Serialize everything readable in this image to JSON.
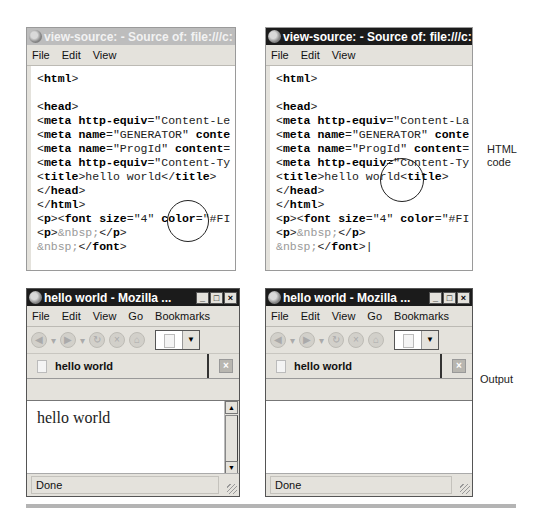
{
  "source_windows": [
    {
      "title": "view-source: - Source of: file:///c:",
      "title_state": "inactive",
      "menu": [
        "File",
        "Edit",
        "View"
      ],
      "code_lines": [
        [
          {
            "t": "<",
            "s": "n"
          },
          {
            "t": "html",
            "s": "b"
          },
          {
            "t": ">",
            "s": "n"
          }
        ],
        [],
        [
          {
            "t": "<",
            "s": "n"
          },
          {
            "t": "head",
            "s": "b"
          },
          {
            "t": ">",
            "s": "n"
          }
        ],
        [
          {
            "t": "<",
            "s": "n"
          },
          {
            "t": "meta http-equiv",
            "s": "b"
          },
          {
            "t": "=\"Content-Le",
            "s": "n"
          }
        ],
        [
          {
            "t": "<",
            "s": "n"
          },
          {
            "t": "meta name",
            "s": "b"
          },
          {
            "t": "=\"GENERATOR\" ",
            "s": "n"
          },
          {
            "t": "conte",
            "s": "b"
          }
        ],
        [
          {
            "t": "<",
            "s": "n"
          },
          {
            "t": "meta name",
            "s": "b"
          },
          {
            "t": "=\"ProgId\" ",
            "s": "n"
          },
          {
            "t": "content",
            "s": "b"
          },
          {
            "t": "=",
            "s": "n"
          }
        ],
        [
          {
            "t": "<",
            "s": "n"
          },
          {
            "t": "meta http-equiv",
            "s": "b"
          },
          {
            "t": "=\"Content-Ty",
            "s": "n"
          }
        ],
        [
          {
            "t": "<",
            "s": "n"
          },
          {
            "t": "title",
            "s": "b"
          },
          {
            "t": ">hello world</",
            "s": "n"
          },
          {
            "t": "title",
            "s": "b"
          },
          {
            "t": ">",
            "s": "n"
          }
        ],
        [
          {
            "t": "</",
            "s": "n"
          },
          {
            "t": "head",
            "s": "b"
          },
          {
            "t": ">",
            "s": "n"
          }
        ],
        [
          {
            "t": "</",
            "s": "n"
          },
          {
            "t": "html",
            "s": "b"
          },
          {
            "t": ">",
            "s": "n"
          }
        ],
        [
          {
            "t": "<",
            "s": "n"
          },
          {
            "t": "p",
            "s": "b"
          },
          {
            "t": "><",
            "s": "n"
          },
          {
            "t": "font size",
            "s": "b"
          },
          {
            "t": "=\"4\" ",
            "s": "n"
          },
          {
            "t": "color",
            "s": "b"
          },
          {
            "t": "=\"#FI",
            "s": "n"
          }
        ],
        [
          {
            "t": "<",
            "s": "n"
          },
          {
            "t": "p",
            "s": "b"
          },
          {
            "t": ">",
            "s": "n"
          },
          {
            "t": "&nbsp;",
            "s": "g"
          },
          {
            "t": "</",
            "s": "n"
          },
          {
            "t": "p",
            "s": "b"
          },
          {
            "t": ">",
            "s": "n"
          }
        ],
        [
          {
            "t": "&nbsp;",
            "s": "g"
          },
          {
            "t": "</",
            "s": "n"
          },
          {
            "t": "font",
            "s": "b"
          },
          {
            "t": ">",
            "s": "n"
          }
        ]
      ]
    },
    {
      "title": "view-source: - Source of: file:///c:",
      "title_state": "active",
      "menu": [
        "File",
        "Edit",
        "View"
      ],
      "code_lines": [
        [
          {
            "t": "<",
            "s": "n"
          },
          {
            "t": "html",
            "s": "b"
          },
          {
            "t": ">",
            "s": "n"
          }
        ],
        [],
        [
          {
            "t": "<",
            "s": "n"
          },
          {
            "t": "head",
            "s": "b"
          },
          {
            "t": ">",
            "s": "n"
          }
        ],
        [
          {
            "t": "<",
            "s": "n"
          },
          {
            "t": "meta http-equiv",
            "s": "b"
          },
          {
            "t": "=\"Content-La",
            "s": "n"
          }
        ],
        [
          {
            "t": "<",
            "s": "n"
          },
          {
            "t": "meta name",
            "s": "b"
          },
          {
            "t": "=\"GENERATOR\" ",
            "s": "n"
          },
          {
            "t": "conte",
            "s": "b"
          }
        ],
        [
          {
            "t": "<",
            "s": "n"
          },
          {
            "t": "meta name",
            "s": "b"
          },
          {
            "t": "=\"ProgId\" ",
            "s": "n"
          },
          {
            "t": "content",
            "s": "b"
          },
          {
            "t": "=",
            "s": "n"
          }
        ],
        [
          {
            "t": "<",
            "s": "n"
          },
          {
            "t": "meta http-equiv",
            "s": "b"
          },
          {
            "t": "=\"Content-Ty",
            "s": "n"
          }
        ],
        [
          {
            "t": "<",
            "s": "n"
          },
          {
            "t": "title",
            "s": "b"
          },
          {
            "t": ">hello world<",
            "s": "n"
          },
          {
            "t": "title",
            "s": "b"
          },
          {
            "t": ">",
            "s": "n"
          }
        ],
        [
          {
            "t": "</",
            "s": "n"
          },
          {
            "t": "head",
            "s": "b"
          },
          {
            "t": ">",
            "s": "n"
          }
        ],
        [
          {
            "t": "</",
            "s": "n"
          },
          {
            "t": "html",
            "s": "b"
          },
          {
            "t": ">",
            "s": "n"
          }
        ],
        [
          {
            "t": "<",
            "s": "n"
          },
          {
            "t": "p",
            "s": "b"
          },
          {
            "t": "><",
            "s": "n"
          },
          {
            "t": "font size",
            "s": "b"
          },
          {
            "t": "=\"4\" ",
            "s": "n"
          },
          {
            "t": "color",
            "s": "b"
          },
          {
            "t": "=\"#FI",
            "s": "n"
          }
        ],
        [
          {
            "t": "<",
            "s": "n"
          },
          {
            "t": "p",
            "s": "b"
          },
          {
            "t": ">",
            "s": "n"
          },
          {
            "t": "&nbsp;",
            "s": "g"
          },
          {
            "t": "</",
            "s": "n"
          },
          {
            "t": "p",
            "s": "b"
          },
          {
            "t": ">",
            "s": "n"
          }
        ],
        [
          {
            "t": "&nbsp;",
            "s": "g"
          },
          {
            "t": "</",
            "s": "n"
          },
          {
            "t": "font",
            "s": "b"
          },
          {
            "t": ">",
            "s": "n"
          },
          {
            "t": "|",
            "s": "n"
          }
        ]
      ]
    }
  ],
  "browser_windows": [
    {
      "title": "hello world - Mozilla ...",
      "title_state": "active",
      "menu": [
        "File",
        "Edit",
        "View",
        "Go",
        "Bookmarks"
      ],
      "tab_label": "hello world",
      "page_text": "hello world",
      "status": "Done",
      "has_scrollbar": true
    },
    {
      "title": "hello world - Mozilla ...",
      "title_state": "active",
      "menu": [
        "File",
        "Edit",
        "View",
        "Go",
        "Bookmarks"
      ],
      "tab_label": "hello world",
      "page_text": "",
      "status": "Done",
      "has_scrollbar": false
    }
  ],
  "labels": {
    "html_code_line1": "HTML",
    "html_code_line2": "code",
    "output": "Output"
  },
  "window_controls": {
    "minimize": "_",
    "maximize": "□",
    "close": "×"
  },
  "colors": {
    "title_active": "#1b1b1b",
    "title_inactive": "#bdbdbd",
    "chrome": "#e4e2dc"
  }
}
